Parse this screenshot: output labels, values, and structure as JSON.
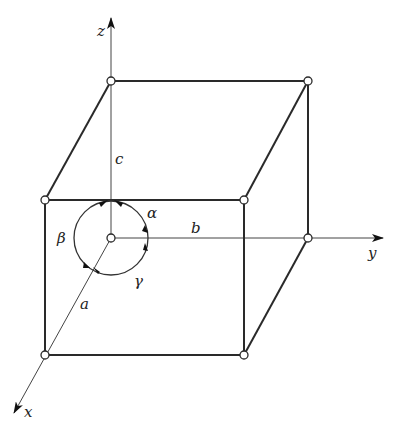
{
  "diagram": {
    "colors": {
      "stroke": "#2a2a2a",
      "background": "#ffffff"
    },
    "axes": {
      "x": {
        "label": "x"
      },
      "y": {
        "label": "y"
      },
      "z": {
        "label": "z"
      }
    },
    "edge_lengths": {
      "a": "a",
      "b": "b",
      "c": "c"
    },
    "angles": {
      "alpha": "α",
      "beta": "β",
      "gamma": "γ"
    },
    "vertices": [
      {
        "id": "origin",
        "x": 111,
        "y": 238
      },
      {
        "id": "top-back-left",
        "x": 111,
        "y": 81
      },
      {
        "id": "top-back-right",
        "x": 308,
        "y": 81
      },
      {
        "id": "back-right",
        "x": 308,
        "y": 238
      },
      {
        "id": "front-top-left",
        "x": 45,
        "y": 200
      },
      {
        "id": "front-top-right",
        "x": 244,
        "y": 200
      },
      {
        "id": "front-bottom-left",
        "x": 45,
        "y": 355
      },
      {
        "id": "front-bottom-right",
        "x": 244,
        "y": 355
      }
    ]
  }
}
